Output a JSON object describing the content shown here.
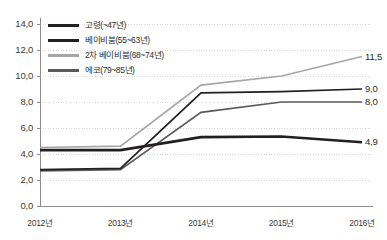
{
  "chart_data": {
    "type": "line",
    "title": "",
    "xlabel": "",
    "ylabel": "",
    "categories": [
      "2012년",
      "2013년",
      "2014년",
      "2015년",
      "2016년"
    ],
    "ylim": [
      0.0,
      14.0
    ],
    "ytick_labels": [
      "0,0",
      "2,0",
      "4,0",
      "6,0",
      "8,0",
      "10,0",
      "12,0",
      "14,0"
    ],
    "ytick_values": [
      0.0,
      2.0,
      4.0,
      6.0,
      8.0,
      10.0,
      12.0,
      14.0
    ],
    "grid": true,
    "legend_position": "top-left-inside",
    "series": [
      {
        "name": "고령(~47년)",
        "color": "#231f20",
        "width": 2.6,
        "values": [
          4.3,
          4.3,
          5.3,
          5.35,
          4.9
        ],
        "end_label": "4,9"
      },
      {
        "name": "베이비붐(55~63년)",
        "color": "#231f20",
        "width": 1.7,
        "values": [
          2.8,
          2.9,
          8.7,
          8.8,
          9.0
        ],
        "end_label": "9,0"
      },
      {
        "name": "2차 베이비붐(68~74년)",
        "color": "#a6a6a6",
        "width": 1.7,
        "values": [
          4.5,
          4.6,
          9.3,
          10.0,
          11.5
        ],
        "end_label": "11,5"
      },
      {
        "name": "에코(79~85년)",
        "color": "#5a5a5a",
        "width": 1.7,
        "values": [
          2.7,
          2.8,
          7.2,
          8.0,
          8.0
        ],
        "end_label": "8,0"
      }
    ]
  },
  "axis": {
    "y_labels": [
      "14,0",
      "12,0",
      "10,0",
      "8,0",
      "6,0",
      "4,0",
      "2,0",
      "0,0"
    ],
    "x_labels": [
      "2012년",
      "2013년",
      "2014년",
      "2015년",
      "2016년"
    ]
  },
  "legend": {
    "items": [
      {
        "label": "고령(~47년)",
        "color": "#231f20",
        "thickness": "3px"
      },
      {
        "label": "베이비붐(55~63년)",
        "color": "#231f20",
        "thickness": "2.6px"
      },
      {
        "label": "2차 베이비붐(68~74년)",
        "color": "#a6a6a6",
        "thickness": "2.4px"
      },
      {
        "label": "에코(79~85년)",
        "color": "#5a5a5a",
        "thickness": "2.4px"
      }
    ]
  },
  "value_labels": [
    {
      "text": "11,5",
      "series": "2차 베이비붐(68~74년)"
    },
    {
      "text": "9,0",
      "series": "베이비붐(55~63년)"
    },
    {
      "text": "8,0",
      "series": "에코(79~85년)"
    },
    {
      "text": "4,9",
      "series": "고령(~47년)"
    }
  ],
  "style": {
    "background": "#ffffff",
    "grid_color": "#d9d9d9",
    "axis_color": "#8c8c8c",
    "text_color": "#3a3a3a"
  }
}
